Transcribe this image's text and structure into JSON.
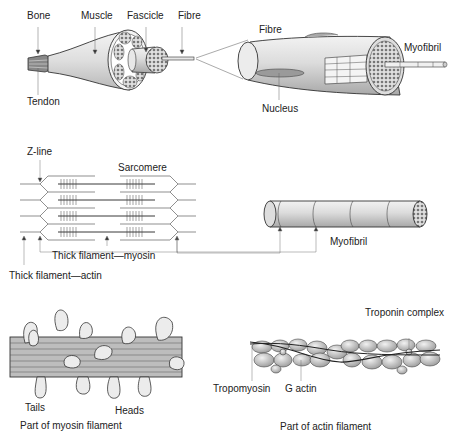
{
  "panel_muscle": {
    "labels": {
      "bone": "Bone",
      "muscle": "Muscle",
      "fascicle": "Fascicle",
      "fibre": "Fibre",
      "tendon": "Tendon"
    }
  },
  "panel_fibre": {
    "labels": {
      "fibre": "Fibre",
      "myofibril": "Myofibril",
      "nucleus": "Nucleus"
    }
  },
  "panel_sarcomere": {
    "labels": {
      "z_line": "Z-line",
      "sarcomere": "Sarcomere",
      "thick_myosin": "Thick filament—myosin",
      "thick_actin": "Thick filament—actin"
    }
  },
  "panel_myofibril": {
    "labels": {
      "myofibril": "Myofibril"
    }
  },
  "panel_myosin": {
    "labels": {
      "tails": "Tails",
      "heads": "Heads",
      "caption": "Part of myosin filament"
    }
  },
  "panel_actin": {
    "labels": {
      "troponin": "Troponin complex",
      "tropomyosin": "Tropomyosin",
      "g_actin": "G actin",
      "caption": "Part of actin filament"
    }
  }
}
